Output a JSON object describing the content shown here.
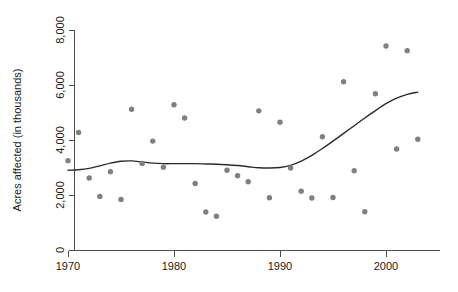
{
  "chart_data": {
    "type": "scatter",
    "title": "",
    "subtitle": "",
    "xlabel": "",
    "ylabel": "Acres affected (in thousands)",
    "xlim": [
      1969,
      2004
    ],
    "ylim": [
      0,
      8000
    ],
    "grid": false,
    "legend": "none",
    "x_tick_labels": [
      "1970",
      "1980",
      "1990",
      "2000"
    ],
    "x_tick_values": [
      1970,
      1980,
      1990,
      2000
    ],
    "y_tick_labels": [
      "0",
      "2,000",
      "4,000",
      "6,000",
      "8,000"
    ],
    "y_tick_values": [
      0,
      2000,
      4000,
      6000,
      8000
    ],
    "point_color": "#808080",
    "line_color": "#2b2b2b",
    "axis_color": "#4d4d4d",
    "background_color": "#ffffff",
    "series": [
      {
        "name": "Acres affected",
        "type": "scatter",
        "x": [
          1970,
          1971,
          1972,
          1973,
          1974,
          1975,
          1976,
          1977,
          1978,
          1979,
          1980,
          1981,
          1982,
          1983,
          1984,
          1985,
          1986,
          1987,
          1988,
          1989,
          1990,
          1991,
          1992,
          1993,
          1994,
          1995,
          1996,
          1997,
          1998,
          1999,
          2000,
          2001,
          2002,
          2003
        ],
        "y": [
          3250,
          4270,
          2620,
          1950,
          2850,
          1840,
          5120,
          3150,
          3960,
          3010,
          5280,
          4800,
          2420,
          1380,
          1230,
          2900,
          2700,
          2480,
          5060,
          1900,
          4650,
          2980,
          2140,
          1890,
          4120,
          1910,
          6120,
          2880,
          1390,
          5680,
          7420,
          3670,
          7250,
          4030
        ]
      },
      {
        "name": "Lowess smooth",
        "type": "line",
        "x": [
          1970,
          1971,
          1972,
          1973,
          1974,
          1975,
          1976,
          1977,
          1978,
          1979,
          1980,
          1981,
          1982,
          1983,
          1984,
          1985,
          1986,
          1987,
          1988,
          1989,
          1990,
          1991,
          1992,
          1993,
          1994,
          1995,
          1996,
          1997,
          1998,
          1999,
          2000,
          2001,
          2002,
          2003
        ],
        "y": [
          2900,
          2920,
          2970,
          3060,
          3160,
          3230,
          3240,
          3200,
          3160,
          3140,
          3140,
          3140,
          3140,
          3130,
          3120,
          3100,
          3070,
          3030,
          2990,
          2980,
          3000,
          3080,
          3230,
          3440,
          3690,
          3960,
          4240,
          4520,
          4800,
          5070,
          5320,
          5520,
          5660,
          5740
        ]
      }
    ]
  },
  "axis": {
    "y_title": "Acres affected (in thousands)"
  }
}
